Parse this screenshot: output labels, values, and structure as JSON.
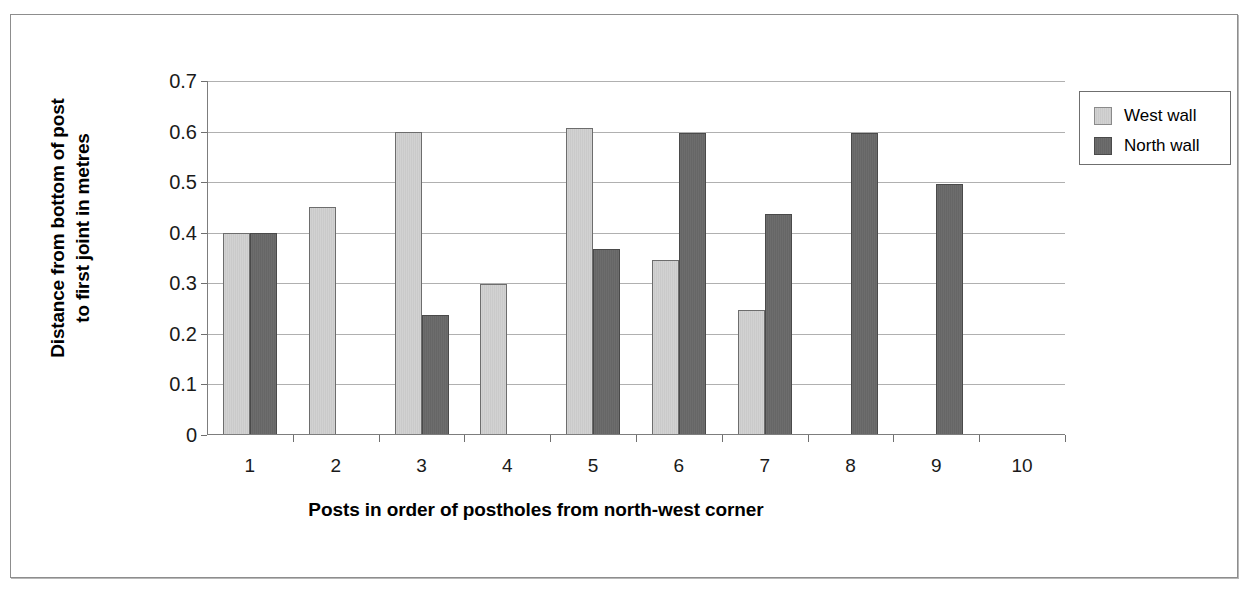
{
  "chart_data": {
    "type": "bar",
    "title": "",
    "xlabel": "Posts in order of postholes from north-west corner",
    "ylabel": "Distance from bottom of post to first joint in metres",
    "ylabel_lines": [
      "Distance from bottom of post",
      "to first joint in metres"
    ],
    "categories": [
      "1",
      "2",
      "3",
      "4",
      "5",
      "6",
      "7",
      "8",
      "9",
      "10"
    ],
    "ylim": [
      0,
      0.7
    ],
    "ytick_labels": [
      "0",
      "0.1",
      "0.2",
      "0.3",
      "0.4",
      "0.5",
      "0.6",
      "0.7"
    ],
    "ytick_values": [
      0,
      0.1,
      0.2,
      0.3,
      0.4,
      0.5,
      0.6,
      0.7
    ],
    "grid": true,
    "legend_position": "right",
    "series": [
      {
        "name": "West wall",
        "color": "#cccccc",
        "values": [
          0.4,
          0.45,
          0.6,
          0.298,
          0.607,
          0.346,
          0.247,
          null,
          null,
          null
        ]
      },
      {
        "name": "North wall",
        "color": "#696969",
        "values": [
          0.4,
          null,
          0.237,
          null,
          0.368,
          0.598,
          0.437,
          0.598,
          0.497,
          null
        ]
      }
    ]
  },
  "legend": {
    "entries": [
      {
        "label": "West wall",
        "swatch": "west"
      },
      {
        "label": "North wall",
        "swatch": "north"
      }
    ]
  }
}
